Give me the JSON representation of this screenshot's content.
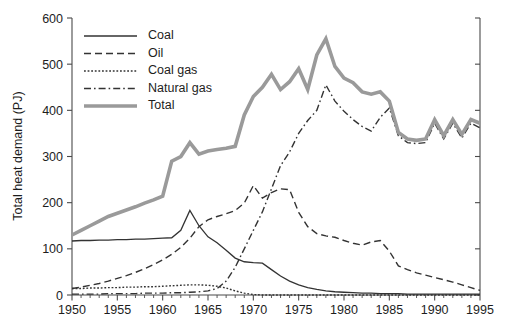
{
  "chart_data": {
    "type": "line",
    "title": "",
    "xlabel": "",
    "ylabel": "Total heat demand (PJ)",
    "xlim": [
      1950,
      1995
    ],
    "ylim": [
      0,
      600
    ],
    "grid": false,
    "legend_position": "top-left-inside",
    "x_major_ticks": [
      1950,
      1955,
      1960,
      1965,
      1970,
      1975,
      1980,
      1985,
      1990,
      1995
    ],
    "x_major_tick_labels": [
      "1950",
      "1955",
      "1960",
      "1965",
      "1970",
      "1975",
      "1980",
      "1985",
      "1990",
      "1995"
    ],
    "x_minor_tick_step": 1,
    "y_ticks": [
      0,
      100,
      200,
      300,
      400,
      500,
      600
    ],
    "y_tick_labels": [
      "0",
      "100",
      "200",
      "300",
      "400",
      "500",
      "600"
    ],
    "x": [
      1950,
      1951,
      1952,
      1953,
      1954,
      1955,
      1956,
      1957,
      1958,
      1959,
      1960,
      1961,
      1962,
      1963,
      1964,
      1965,
      1966,
      1967,
      1968,
      1969,
      1970,
      1971,
      1972,
      1973,
      1974,
      1975,
      1976,
      1977,
      1978,
      1979,
      1980,
      1981,
      1982,
      1983,
      1984,
      1985,
      1986,
      1987,
      1988,
      1989,
      1990,
      1991,
      1992,
      1993,
      1994,
      1995
    ],
    "series": [
      {
        "name": "Coal",
        "style": "solid",
        "color": "#333333",
        "width": 1.3,
        "values": [
          117,
          118,
          118,
          119,
          119,
          120,
          120,
          121,
          121,
          122,
          123,
          124,
          140,
          183,
          150,
          126,
          113,
          97,
          80,
          72,
          70,
          69,
          55,
          41,
          30,
          22,
          16,
          12,
          9,
          7,
          6,
          5,
          4,
          4,
          3,
          3,
          3,
          2,
          2,
          2,
          2,
          2,
          2,
          2,
          2,
          2
        ]
      },
      {
        "name": "Oil",
        "style": "dashed",
        "color": "#333333",
        "width": 1.4,
        "values": [
          14,
          17,
          21,
          25,
          30,
          36,
          42,
          49,
          57,
          66,
          76,
          88,
          103,
          123,
          148,
          163,
          170,
          176,
          183,
          199,
          237,
          210,
          222,
          230,
          228,
          179,
          148,
          133,
          128,
          125,
          118,
          112,
          108,
          115,
          118,
          95,
          63,
          55,
          48,
          43,
          38,
          33,
          28,
          22,
          16,
          10
        ]
      },
      {
        "name": "Coal gas",
        "style": "dotted",
        "color": "#333333",
        "width": 1.4,
        "values": [
          14,
          14,
          15,
          15,
          16,
          16,
          17,
          17,
          18,
          18,
          19,
          20,
          21,
          22,
          22,
          21,
          19,
          15,
          9,
          4,
          1,
          0,
          0,
          0,
          0,
          0,
          0,
          0,
          0,
          0,
          0,
          0,
          0,
          0,
          0,
          0,
          0,
          0,
          0,
          0,
          0,
          0,
          0,
          0,
          0,
          0
        ]
      },
      {
        "name": "Natural gas",
        "style": "dashdot",
        "color": "#333333",
        "width": 1.4,
        "values": [
          2,
          2,
          2,
          2,
          3,
          3,
          3,
          3,
          4,
          4,
          4,
          5,
          5,
          6,
          7,
          9,
          14,
          30,
          60,
          100,
          140,
          180,
          230,
          280,
          310,
          350,
          378,
          400,
          455,
          420,
          398,
          380,
          365,
          355,
          385,
          405,
          345,
          330,
          328,
          330,
          372,
          338,
          372,
          340,
          372,
          362
        ]
      },
      {
        "name": "Total",
        "style": "solid-thick",
        "color": "#9a9a9a",
        "width": 3.6,
        "values": [
          130,
          140,
          150,
          160,
          170,
          177,
          184,
          191,
          199,
          206,
          214,
          290,
          300,
          330,
          305,
          312,
          315,
          318,
          322,
          390,
          430,
          450,
          478,
          445,
          462,
          490,
          445,
          520,
          555,
          495,
          470,
          460,
          440,
          435,
          440,
          420,
          352,
          338,
          335,
          338,
          380,
          345,
          380,
          348,
          380,
          372
        ]
      }
    ]
  },
  "legend": {
    "items": [
      {
        "label": "Coal"
      },
      {
        "label": "Oil"
      },
      {
        "label": "Coal gas"
      },
      {
        "label": "Natural gas"
      },
      {
        "label": "Total"
      }
    ]
  }
}
